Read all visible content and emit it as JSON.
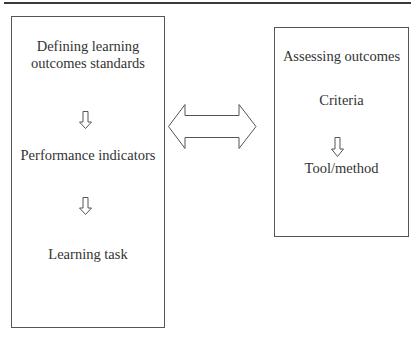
{
  "diagram": {
    "type": "flow",
    "top_rule": true,
    "left_box": {
      "items": [
        {
          "kind": "text",
          "lines": [
            "Defining learning",
            "outcomes standards"
          ]
        },
        {
          "kind": "arrow",
          "direction": "down"
        },
        {
          "kind": "text",
          "lines": [
            "Performance indicators"
          ]
        },
        {
          "kind": "arrow",
          "direction": "down"
        },
        {
          "kind": "text",
          "lines": [
            "Learning task"
          ]
        }
      ],
      "title_line1": "Defining learning",
      "title_line2": "outcomes standards",
      "step2": "Performance indicators",
      "step3": "Learning task"
    },
    "connector": {
      "kind": "double-arrow",
      "direction": "left-right"
    },
    "right_box": {
      "title": "Assessing outcomes",
      "step2": "Criteria",
      "step3": "Tool/method"
    },
    "colors": {
      "stroke": "#555555",
      "text": "#333333",
      "background": "#ffffff"
    }
  }
}
